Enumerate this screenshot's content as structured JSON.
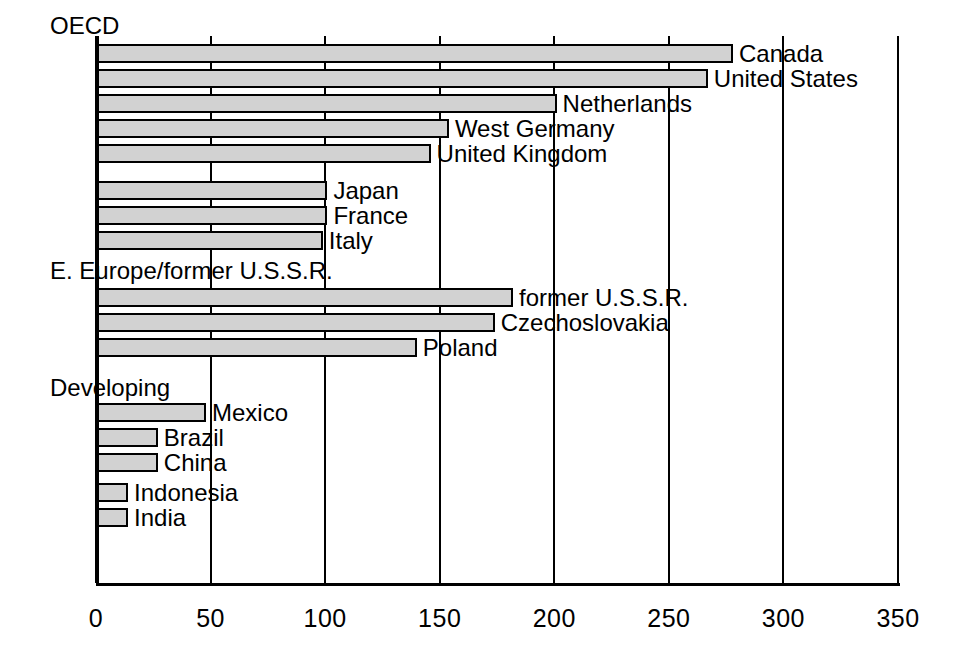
{
  "chart_data": {
    "type": "bar",
    "orientation": "horizontal",
    "title": "",
    "subtitle": "",
    "xlabel": "",
    "ylabel": "",
    "xlim": [
      0,
      350
    ],
    "ylim": null,
    "grid": true,
    "gridlines": "vertical",
    "legend": null,
    "legend_position": "none",
    "xticks": [
      0,
      50,
      100,
      150,
      200,
      250,
      300,
      350
    ],
    "xtick_labels": [
      "0",
      "50",
      "100",
      "150",
      "200",
      "250",
      "300",
      "350"
    ],
    "bar_fill_color": "#d2d2d2",
    "bar_edge_color": "#000000",
    "groups": [
      {
        "name": "OECD",
        "categories": [
          "Canada",
          "United States",
          "Netherlands",
          "West Germany",
          "United Kingdom",
          "Japan",
          "France",
          "Italy"
        ],
        "values": [
          278,
          267,
          201,
          154,
          146,
          101,
          101,
          99
        ]
      },
      {
        "name": "E. Europe/former U.S.S.R.",
        "categories": [
          "former U.S.S.R.",
          "Czechoslovakia",
          "Poland"
        ],
        "values": [
          182,
          174,
          140
        ]
      },
      {
        "name": "Developing",
        "categories": [
          "Mexico",
          "Brazil",
          "China",
          "Indonesia",
          "India"
        ],
        "values": [
          48,
          27,
          27,
          14,
          14
        ]
      }
    ]
  },
  "axis": {
    "ticks": [
      {
        "label": "0",
        "value": 0
      },
      {
        "label": "50",
        "value": 50
      },
      {
        "label": "100",
        "value": 100
      },
      {
        "label": "150",
        "value": 150
      },
      {
        "label": "200",
        "value": 200
      },
      {
        "label": "250",
        "value": 250
      },
      {
        "label": "300",
        "value": 300
      },
      {
        "label": "350",
        "value": 350
      }
    ]
  },
  "colors": {
    "bar_fill": "#d2d2d2",
    "bar_edge": "#000000",
    "axis": "#000000",
    "background": "#ffffff",
    "text": "#000000"
  }
}
